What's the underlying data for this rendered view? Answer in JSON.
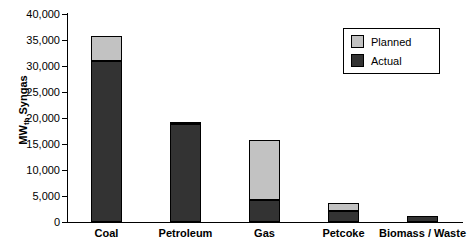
{
  "chart_data": {
    "type": "bar",
    "title": "",
    "subtitle": "",
    "xlabel": "",
    "ylabel": "MWth Syngas",
    "ylabel_main": "MW",
    "ylabel_sub": "th",
    "ylabel_tail": " Syngas",
    "categories": [
      "Coal",
      "Petroleum",
      "Gas",
      "Petcoke",
      "Biomass / Waste"
    ],
    "series": [
      {
        "name": "Actual",
        "values": [
          31000,
          18800,
          4300,
          2200,
          1200
        ],
        "color": "#333333"
      },
      {
        "name": "Planned",
        "values": [
          4800,
          400,
          11500,
          1400,
          0
        ],
        "color": "#c2c2c2"
      }
    ],
    "totals": [
      35800,
      19200,
      15800,
      3600,
      1200
    ],
    "stacked": true,
    "stack_order": [
      "Actual",
      "Planned"
    ],
    "ylim": [
      0,
      40000
    ],
    "ytick_step": 5000,
    "ytick_labels": [
      "0",
      "5,000",
      "10,000",
      "15,000",
      "20,000",
      "25,000",
      "30,000",
      "35,000",
      "40,000"
    ],
    "ytick_values": [
      0,
      5000,
      10000,
      15000,
      20000,
      25000,
      30000,
      35000,
      40000
    ],
    "grid": false,
    "legend_position": "top-right",
    "legend_entries": [
      "Planned",
      "Actual"
    ]
  },
  "legend": {
    "planned_label": "Planned",
    "actual_label": "Actual"
  },
  "caption": {
    "text": ""
  }
}
